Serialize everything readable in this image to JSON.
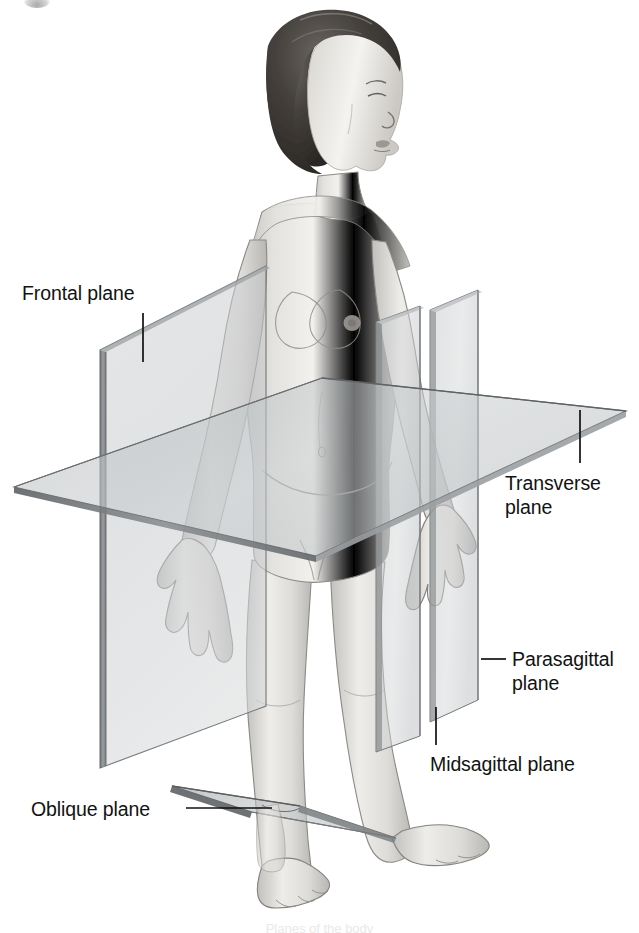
{
  "figure": {
    "title": "Planes of the body",
    "background_color": "#ffffff",
    "width": 639,
    "height": 933,
    "caption_partial": "Planes of the body",
    "line_color": "#111111",
    "label_color": "#121212",
    "plane_fill": "#b9bcbd",
    "plane_edge": "#6d7173"
  },
  "labels": [
    {
      "id": "frontal",
      "text": "Frontal plane",
      "x": 22,
      "y": 281,
      "leader": {
        "type": "vertical",
        "x": 143,
        "y1": 313,
        "y2": 362
      }
    },
    {
      "id": "transverse",
      "text": "Transverse\nplane",
      "x": 505,
      "y": 471,
      "leader": {
        "type": "vertical",
        "x": 580,
        "y1": 410,
        "y2": 463
      }
    },
    {
      "id": "parasagittal",
      "text": "Parasagittal\nplane",
      "x": 512,
      "y": 647,
      "leader": {
        "type": "horizontal",
        "y": 659,
        "x1": 481,
        "x2": 506
      }
    },
    {
      "id": "midsagittal",
      "text": "Midsagittal plane",
      "x": 430,
      "y": 752,
      "leader": {
        "type": "vertical",
        "x": 436,
        "y1": 707,
        "y2": 745
      }
    },
    {
      "id": "oblique",
      "text": "Oblique plane",
      "x": 31,
      "y": 797,
      "leader": {
        "type": "horizontal",
        "y": 808,
        "x1": 186,
        "x2": 272
      }
    }
  ],
  "planes": [
    {
      "id": "frontal-plane",
      "name": "Frontal plane",
      "orientation": "coronal / vertical, divides anterior from posterior"
    },
    {
      "id": "transverse-plane",
      "name": "Transverse plane",
      "orientation": "horizontal, divides superior from inferior"
    },
    {
      "id": "midsagittal-plane",
      "name": "Midsagittal plane",
      "orientation": "vertical at midline, divides left from right equally"
    },
    {
      "id": "parasagittal-plane",
      "name": "Parasagittal plane",
      "orientation": "vertical parallel to midline, unequal left/right division"
    },
    {
      "id": "oblique-plane",
      "name": "Oblique plane",
      "orientation": "angled, cuts at a slant through the ankle"
    }
  ]
}
